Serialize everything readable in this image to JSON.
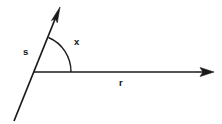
{
  "figure": {
    "kind": "geometry-angle-diagram",
    "background_color": "#ffffff",
    "stroke_color": "#1a1a1a",
    "label_color": "#111111",
    "width": 222,
    "height": 124
  },
  "labels": {
    "arc_label": "x",
    "diagonal_ray_label": "s",
    "horizontal_ray_label": "r"
  },
  "geometry": {
    "vertex": {
      "x": 34,
      "y": 72
    },
    "horizontal_ray": {
      "start_x": 34,
      "start_y": 72,
      "end_x": 214,
      "end_y": 72,
      "has_arrowhead": true
    },
    "diagonal_ray": {
      "start_x": 14,
      "start_y": 121,
      "end_x": 60,
      "end_y": 7,
      "has_arrowhead": true
    },
    "arc": {
      "center_x": 34,
      "center_y": 72,
      "radius": 37,
      "start_x": 48,
      "start_y": 37,
      "end_x": 71,
      "end_y": 72
    },
    "label_positions": {
      "arc_label": {
        "x": 74,
        "y": 45
      },
      "diagonal_ray_label": {
        "x": 23,
        "y": 55
      },
      "horizontal_ray_label": {
        "x": 119,
        "y": 86
      }
    }
  }
}
